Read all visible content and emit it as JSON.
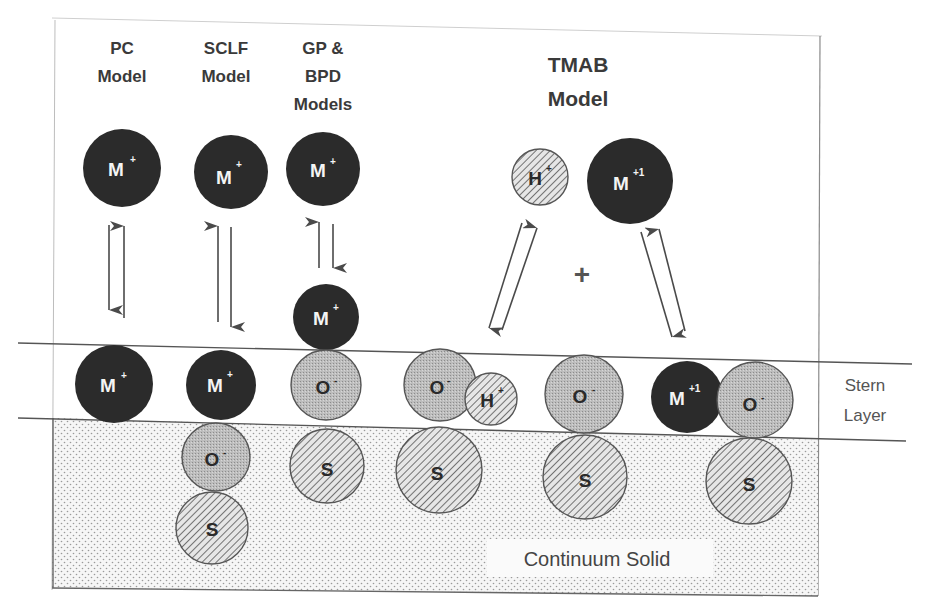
{
  "diagram": {
    "type": "surface-complexation-models",
    "models": [
      {
        "id": "pc",
        "title_lines": [
          "PC",
          "Model"
        ]
      },
      {
        "id": "sclf",
        "title_lines": [
          "SCLF",
          "Model"
        ]
      },
      {
        "id": "gp",
        "title_lines": [
          "GP &",
          "BPD",
          "Models"
        ]
      },
      {
        "id": "tmab",
        "title_lines": [
          "TMAB",
          "Model"
        ]
      }
    ],
    "species": {
      "metal": {
        "base": "M",
        "charge": "+"
      },
      "metal_tmab": {
        "base": "M",
        "charge": "+1"
      },
      "proton": {
        "base": "H",
        "charge": "+"
      },
      "oxygen": {
        "base": "O",
        "charge": "-"
      },
      "solid": {
        "base": "S",
        "charge": ""
      }
    },
    "plus_sign": "+",
    "regions": {
      "stern_layer": [
        "Stern",
        "Layer"
      ],
      "continuum_solid": "Continuum Solid"
    },
    "colors": {
      "metal_fill": "#2b2b2b",
      "oxygen_fill": "#b5b5b5",
      "hatch_fill": "#d8d8d8",
      "line": "#555555",
      "solid_bg": "#f0f0f0"
    }
  }
}
